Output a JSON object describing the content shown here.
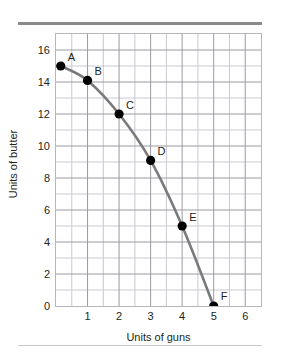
{
  "figure": {
    "top_rule_color": "#8a8a8a",
    "bottom_rule_color": "#c8c8c8"
  },
  "chart_data": {
    "type": "line",
    "title": "",
    "subtitle": "",
    "xlabel": "Units of guns",
    "ylabel": "Units of butter",
    "xlim": [
      0,
      6.5
    ],
    "ylim": [
      0,
      17
    ],
    "grid": true,
    "minor_grid": true,
    "legend": null,
    "xticks": [
      1,
      2,
      3,
      4,
      5,
      6
    ],
    "xtick_labels": [
      "1",
      "2",
      "3",
      "4",
      "5",
      "6"
    ],
    "yticks": [
      0,
      2,
      4,
      6,
      8,
      10,
      12,
      14,
      16
    ],
    "ytick_labels": [
      "0",
      "2",
      "4",
      "6",
      "8",
      "10",
      "12",
      "14",
      "16"
    ],
    "series": [
      {
        "name": "Production possibilities frontier",
        "line_color": "#7a7a7a",
        "marker_color": "#000000",
        "points": [
          {
            "label": "A",
            "x": 0.15,
            "y": 15.0
          },
          {
            "label": "B",
            "x": 1.0,
            "y": 14.1
          },
          {
            "label": "C",
            "x": 2.0,
            "y": 12.0
          },
          {
            "label": "D",
            "x": 3.0,
            "y": 9.1
          },
          {
            "label": "E",
            "x": 4.0,
            "y": 5.0
          },
          {
            "label": "F",
            "x": 5.0,
            "y": 0.0
          }
        ]
      }
    ],
    "point_labels": [
      "A",
      "B",
      "C",
      "D",
      "E",
      "F"
    ],
    "annotations": []
  }
}
